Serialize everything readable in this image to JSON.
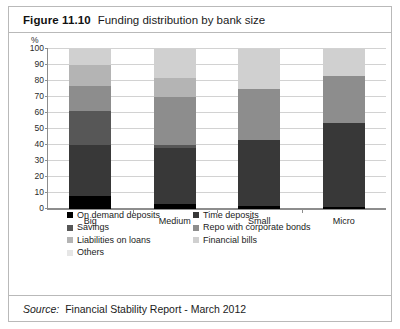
{
  "figure": {
    "label": "Figure 11.10",
    "title": "Funding distribution by bank size"
  },
  "source": {
    "label": "Source:",
    "text": "Financial Stability Report - March 2012"
  },
  "chart_data": {
    "type": "bar",
    "stacked": true,
    "title": "Funding distribution by bank size",
    "xlabel": "",
    "ylabel": "%",
    "ylim": [
      0,
      100
    ],
    "yticks": [
      0,
      10,
      20,
      30,
      40,
      50,
      60,
      70,
      80,
      90,
      100
    ],
    "grid": true,
    "legend_position": "bottom",
    "categories": [
      "Big",
      "Medium",
      "Small",
      "Micro"
    ],
    "series": [
      {
        "name": "On demand deposits",
        "color": "#000000",
        "values": [
          8,
          3,
          2,
          1
        ]
      },
      {
        "name": "Time deposits",
        "color": "#383838",
        "values": [
          32,
          35,
          41,
          53
        ]
      },
      {
        "name": "Savings",
        "color": "#575757",
        "values": [
          21,
          2,
          0,
          0
        ]
      },
      {
        "name": "Repo with corporate bonds",
        "color": "#8d8d8d",
        "values": [
          16,
          30,
          32,
          29
        ]
      },
      {
        "name": "Liabilities on loans",
        "color": "#b4b4b4",
        "values": [
          13,
          12,
          0,
          0
        ]
      },
      {
        "name": "Financial bills",
        "color": "#d0d0d0",
        "values": [
          10,
          18,
          25,
          17
        ]
      },
      {
        "name": "Others",
        "color": "#e6e6e6",
        "values": [
          0,
          0,
          0,
          0
        ]
      }
    ]
  },
  "legend": [
    {
      "label": "On demand deposits",
      "color": "#000000"
    },
    {
      "label": "Time deposits",
      "color": "#383838"
    },
    {
      "label": "Savings",
      "color": "#575757"
    },
    {
      "label": "Repo with corporate bonds",
      "color": "#8d8d8d"
    },
    {
      "label": "Liabilities on loans",
      "color": "#b4b4b4"
    },
    {
      "label": "Financial bills",
      "color": "#d0d0d0"
    },
    {
      "label": "Others",
      "color": "#e6e6e6"
    }
  ]
}
